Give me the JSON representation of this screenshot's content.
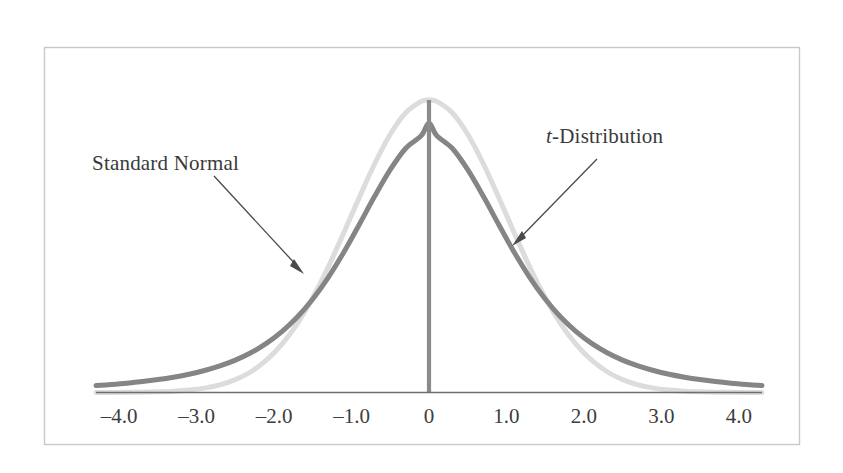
{
  "figure": {
    "background_color": "#ffffff",
    "frame_color": "#c9c9c9",
    "axis_color": "#6e6e6e"
  },
  "annotations": {
    "standard_normal": {
      "text": "Standard Normal",
      "italic_prefix": "",
      "color": "#3a3a3a"
    },
    "t_distribution": {
      "italic_prefix": "t",
      "text": "-Distribution",
      "color": "#3a3a3a"
    }
  },
  "axis": {
    "tick_labels": [
      "–4.0",
      "–3.0",
      "–2.0",
      "–1.0",
      "0",
      "1.0",
      "2.0",
      "3.0",
      "4.0"
    ],
    "tick_values": [
      -4,
      -3,
      -2,
      -1,
      0,
      1,
      2,
      3,
      4
    ]
  },
  "chart_data": {
    "type": "line",
    "title": "",
    "subtitle": "",
    "xlabel": "",
    "ylabel": "",
    "xlim": [
      -4.3,
      4.3
    ],
    "ylim": [
      0,
      0.42
    ],
    "grid": false,
    "legend_position": "inline-annotations",
    "xticks": [
      -4,
      -3,
      -2,
      -1,
      0,
      1,
      2,
      3,
      4
    ],
    "xticklabels": [
      "–4.0",
      "–3.0",
      "–2.0",
      "–1.0",
      "0",
      "1.0",
      "2.0",
      "3.0",
      "4.0"
    ],
    "yticks": [],
    "yticklabels": [],
    "annotations": [
      {
        "label": "Standard Normal",
        "points_to_series": "Standard Normal",
        "arrow_from_x": -2.73,
        "arrow_from_y": 0.246,
        "arrow_to_x": -1.62,
        "arrow_to_y": 0.108
      },
      {
        "label": "t-Distribution",
        "points_to_series": "t-Distribution",
        "arrow_from_x": 1.93,
        "arrow_from_y": 0.268,
        "arrow_to_x": 0.91,
        "arrow_to_y": 0.155
      }
    ],
    "center_line": {
      "x": 0,
      "y_top": 0.3989,
      "y_bottom": 0,
      "color": "#8b8b8b"
    },
    "x": [
      -4.3,
      -4.1,
      -3.9,
      -3.7,
      -3.5,
      -3.3,
      -3.1,
      -2.9,
      -2.7,
      -2.5,
      -2.3,
      -2.1,
      -1.9,
      -1.7,
      -1.5,
      -1.3,
      -1.1,
      -0.9,
      -0.7,
      -0.5,
      -0.3,
      -0.1,
      0,
      0.1,
      0.3,
      0.5,
      0.7,
      0.9,
      1.1,
      1.3,
      1.5,
      1.7,
      1.9,
      2.1,
      2.3,
      2.5,
      2.7,
      2.9,
      3.1,
      3.3,
      3.5,
      3.7,
      3.9,
      4.1,
      4.3
    ],
    "series": [
      {
        "name": "Standard Normal",
        "color": "#dcdcdc",
        "peak_value": 0.3989,
        "values": [
          4e-05,
          9e-05,
          0.0002,
          0.0004,
          0.0009,
          0.0017,
          0.0033,
          0.006,
          0.0104,
          0.0175,
          0.0283,
          0.044,
          0.0656,
          0.094,
          0.1295,
          0.1714,
          0.2179,
          0.2661,
          0.3123,
          0.3521,
          0.3814,
          0.397,
          0.3989,
          0.397,
          0.3814,
          0.3521,
          0.3123,
          0.2661,
          0.2179,
          0.1714,
          0.1295,
          0.094,
          0.0656,
          0.044,
          0.0283,
          0.0175,
          0.0104,
          0.006,
          0.0033,
          0.0017,
          0.0009,
          0.0004,
          0.0002,
          9e-05,
          4e-05
        ]
      },
      {
        "name": "t-Distribution",
        "color": "#858585",
        "degrees_of_freedom": 3,
        "peak_value": 0.3676,
        "values": [
          0.0094,
          0.0109,
          0.0127,
          0.0149,
          0.0176,
          0.0209,
          0.0249,
          0.03,
          0.0363,
          0.0442,
          0.0542,
          0.0669,
          0.0829,
          0.1029,
          0.1275,
          0.1571,
          0.1914,
          0.2292,
          0.2679,
          0.3039,
          0.3331,
          0.3503,
          0.3676,
          0.3503,
          0.3331,
          0.3039,
          0.2679,
          0.2292,
          0.1914,
          0.1571,
          0.1275,
          0.1029,
          0.0829,
          0.0669,
          0.0542,
          0.0442,
          0.0363,
          0.03,
          0.0249,
          0.0209,
          0.0176,
          0.0149,
          0.0127,
          0.0109,
          0.0094
        ]
      }
    ]
  }
}
